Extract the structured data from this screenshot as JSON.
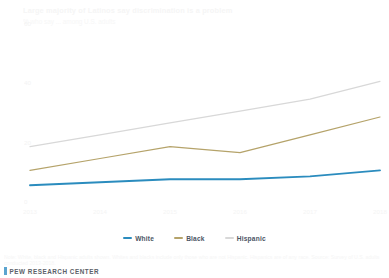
{
  "header": {
    "title": "Large majority of Latinos say discrimination is a problem",
    "subtitle": "% who say ... among U.S. adults"
  },
  "legend": {
    "position": "bottom-center",
    "entries": [
      {
        "label": "White",
        "color": "#2b8cbe"
      },
      {
        "label": "Black",
        "color": "#b5a36a"
      },
      {
        "label": "Hispanic",
        "color": "#d8d8d8"
      }
    ]
  },
  "footer": {
    "note": "Note: White, black and Hispanic adults shown. Whites and blacks include only those who are not Hispanic. Hispanics are of any race. Source: Survey of U.S. adults conducted 2013-2018.",
    "source": "PEW RESEARCH CENTER"
  },
  "chart_data": {
    "type": "line",
    "title": "Large majority of Latinos say discrimination is a problem",
    "subtitle": "% who say ... among U.S. adults",
    "xlabel": "",
    "ylabel": "",
    "x": [
      "2013",
      "2014",
      "2015",
      "2016",
      "2017",
      "2018"
    ],
    "xtick_labels": [
      "2013",
      "2014",
      "2015",
      "2016",
      "2017",
      "2018"
    ],
    "ytick_labels": [
      "60",
      "40",
      "20",
      "0"
    ],
    "ytick_values": [
      60,
      40,
      20,
      0
    ],
    "ylim": [
      0,
      60
    ],
    "grid": false,
    "series": [
      {
        "name": "White",
        "color": "#2b8cbe",
        "values": [
          7,
          8,
          9,
          9,
          10,
          12
        ]
      },
      {
        "name": "Black",
        "color": "#b5a36a",
        "values": [
          12,
          16,
          20,
          18,
          24,
          30
        ]
      },
      {
        "name": "Hispanic",
        "color": "#d8d8d8",
        "values": [
          20,
          24,
          28,
          32,
          36,
          42
        ]
      }
    ]
  }
}
